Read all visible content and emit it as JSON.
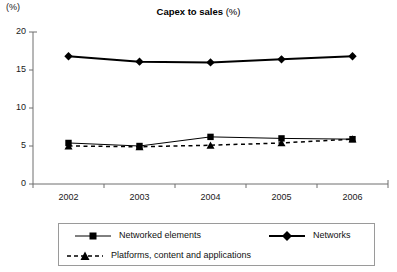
{
  "chart_data": {
    "type": "line",
    "title_main": "Capex to sales",
    "title_unit": "(%)",
    "axis_unit_label": "(%)",
    "xlabel": "",
    "ylabel": "",
    "categories": [
      "2002",
      "2003",
      "2004",
      "2005",
      "2006"
    ],
    "ylim": [
      0,
      20
    ],
    "yticks": [
      0,
      5,
      10,
      15,
      20
    ],
    "ytick_labels": [
      "0",
      "5",
      "10",
      "15",
      "20"
    ],
    "grid": false,
    "legend_position": "bottom",
    "series": [
      {
        "name": "Networked elements",
        "marker": "square",
        "line_style": "solid",
        "line_width": 1,
        "color": "#000000",
        "values": [
          5.4,
          5.0,
          6.2,
          6.0,
          5.9
        ]
      },
      {
        "name": "Networks",
        "marker": "diamond",
        "line_style": "solid",
        "line_width": 2,
        "color": "#000000",
        "values": [
          16.8,
          16.1,
          16.0,
          16.4,
          16.8
        ]
      },
      {
        "name": "Platforms, content and applications",
        "marker": "triangle",
        "line_style": "dashed",
        "line_width": 1.5,
        "color": "#000000",
        "values": [
          5.0,
          4.9,
          5.1,
          5.4,
          5.9
        ]
      }
    ]
  },
  "legend": {
    "items": [
      {
        "label": "Networked elements"
      },
      {
        "label": "Networks"
      },
      {
        "label": "Platforms, content and applications"
      }
    ]
  },
  "axis": {
    "y_unit": "(%)",
    "x_labels": [
      "2002",
      "2003",
      "2004",
      "2005",
      "2006"
    ],
    "y_labels": [
      "20",
      "15",
      "10",
      "5",
      "0"
    ]
  }
}
